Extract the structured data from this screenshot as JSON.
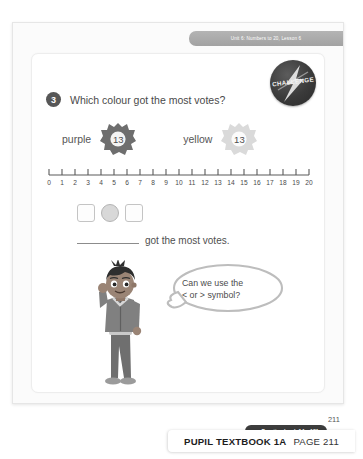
{
  "page": {
    "unit_banner": "Unit 6: Numbers to 20, Lesson 6",
    "page_number": "211"
  },
  "challenge_badge": {
    "label": "CHALLENGE",
    "icon": "lightning-bolt-icon",
    "color": "#2b2b2b"
  },
  "question": {
    "number": "3",
    "text": "Which colour got the most votes?"
  },
  "votes": [
    {
      "label": "purple",
      "count": "13",
      "color": "#6e6e6e"
    },
    {
      "label": "yellow",
      "count": "13",
      "color": "#d9d9d9"
    }
  ],
  "number_line": {
    "min": 0,
    "max": 20,
    "ticks": [
      "0",
      "1",
      "2",
      "3",
      "4",
      "5",
      "6",
      "7",
      "8",
      "9",
      "10",
      "11",
      "12",
      "13",
      "14",
      "15",
      "16",
      "17",
      "18",
      "19",
      "20"
    ]
  },
  "comparison": {
    "left_box": "",
    "symbol_slot": "",
    "right_box": ""
  },
  "blank_sentence": {
    "blank": "",
    "text": "got the most votes."
  },
  "speech_bubble": {
    "line1": "Can we use the",
    "line2": "< or > symbol?"
  },
  "character": {
    "name": "boy-thinking-character"
  },
  "practice_link": {
    "arrow": "→",
    "text": "Practice book 1A p181"
  },
  "footer": {
    "title": "PUPIL TEXTBOOK 1A",
    "page_label": "PAGE 211"
  }
}
